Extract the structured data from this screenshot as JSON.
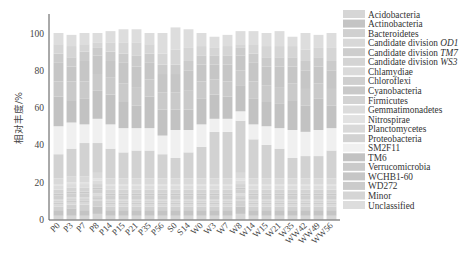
{
  "chart_data": {
    "type": "bar",
    "stacked": true,
    "title": "",
    "xlabel": "",
    "ylabel": "相对丰度/%",
    "ylim": [
      0,
      100
    ],
    "yticks": [
      0,
      20,
      40,
      60,
      80,
      100
    ],
    "grid": false,
    "legend_position": "right",
    "categories": [
      "P0",
      "P3",
      "P7",
      "P8",
      "P14",
      "P15",
      "P21",
      "P35",
      "P56",
      "S0",
      "S14",
      "W0",
      "W3",
      "W7",
      "W8",
      "W14",
      "W15",
      "W21",
      "W35",
      "WW42",
      "WW49",
      "WW56"
    ],
    "series": [
      {
        "name": "Acidobacteria",
        "color": "#d6d6d6",
        "values": [
          2,
          2,
          2,
          3,
          2,
          2,
          2,
          2,
          2,
          2,
          2,
          2,
          2,
          2,
          3,
          2,
          2,
          2,
          2,
          2,
          2,
          2
        ]
      },
      {
        "name": "Actinobacteria",
        "color": "#c4c4c4",
        "values": [
          3,
          4,
          3,
          4,
          3,
          3,
          3,
          3,
          3,
          3,
          3,
          3,
          3,
          3,
          4,
          3,
          3,
          3,
          3,
          3,
          3,
          3
        ]
      },
      {
        "name": "Bacteroidetes",
        "color": "#d0d0d0",
        "values": [
          2,
          2,
          3,
          3,
          2,
          2,
          2,
          2,
          2,
          2,
          2,
          2,
          2,
          2,
          3,
          2,
          2,
          2,
          2,
          2,
          2,
          2
        ]
      },
      {
        "name": "Candidate division OD1",
        "color": "#d8d8d8",
        "values": [
          1,
          1,
          1,
          1,
          1,
          1,
          1,
          1,
          1,
          1,
          1,
          1,
          1,
          1,
          1,
          1,
          1,
          1,
          1,
          1,
          1,
          1
        ]
      },
      {
        "name": "Candidate division TM7",
        "color": "#cdcdcd",
        "values": [
          1,
          1,
          1,
          1,
          1,
          1,
          1,
          1,
          1,
          1,
          1,
          1,
          1,
          1,
          1,
          1,
          1,
          1,
          1,
          1,
          1,
          1
        ]
      },
      {
        "name": "Candidate division WS3",
        "color": "#d4d4d4",
        "values": [
          1,
          1,
          1,
          1,
          1,
          1,
          1,
          1,
          1,
          1,
          1,
          1,
          1,
          1,
          1,
          1,
          1,
          1,
          1,
          1,
          1,
          1
        ]
      },
      {
        "name": "Chlamydiae",
        "color": "#dadada",
        "values": [
          1,
          1,
          1,
          1,
          1,
          1,
          1,
          1,
          1,
          1,
          1,
          1,
          1,
          1,
          1,
          1,
          1,
          1,
          1,
          1,
          1,
          1
        ]
      },
      {
        "name": "Chloroflexi",
        "color": "#cfcfcf",
        "values": [
          2,
          2,
          2,
          2,
          2,
          2,
          2,
          2,
          2,
          2,
          2,
          2,
          2,
          2,
          2,
          2,
          2,
          2,
          2,
          2,
          2,
          2
        ]
      },
      {
        "name": "Cyanobacteria",
        "color": "#c9c9c9",
        "values": [
          1,
          1,
          1,
          1,
          1,
          1,
          1,
          1,
          1,
          1,
          1,
          1,
          1,
          1,
          1,
          1,
          1,
          1,
          1,
          1,
          1,
          1
        ]
      },
      {
        "name": "Firmicutes",
        "color": "#d3d3d3",
        "values": [
          2,
          2,
          2,
          2,
          2,
          2,
          2,
          2,
          2,
          2,
          2,
          2,
          2,
          2,
          2,
          2,
          2,
          2,
          2,
          2,
          2,
          2
        ]
      },
      {
        "name": "Gemmatimonadetes",
        "color": "#dcdcdc",
        "values": [
          2,
          2,
          2,
          2,
          2,
          2,
          2,
          2,
          2,
          2,
          2,
          2,
          2,
          2,
          2,
          2,
          2,
          2,
          2,
          2,
          2,
          2
        ]
      },
      {
        "name": "Nitrospirae",
        "color": "#e2e2e2",
        "values": [
          1,
          1,
          1,
          1,
          1,
          1,
          1,
          1,
          1,
          1,
          1,
          1,
          1,
          1,
          1,
          1,
          1,
          1,
          1,
          1,
          1,
          1
        ]
      },
      {
        "name": "Planctomycetes",
        "color": "#d9d9d9",
        "values": [
          3,
          3,
          3,
          3,
          3,
          3,
          3,
          3,
          3,
          3,
          3,
          3,
          3,
          3,
          3,
          3,
          3,
          3,
          3,
          3,
          3,
          3
        ]
      },
      {
        "name": "Proteobacteria",
        "color": "#d2d2d2",
        "values": [
          13,
          15,
          18,
          16,
          16,
          14,
          15,
          15,
          13,
          11,
          14,
          17,
          25,
          25,
          28,
          21,
          18,
          16,
          11,
          12,
          12,
          15
        ]
      },
      {
        "name": "SM2F11",
        "color": "#f0f0f0",
        "values": [
          15,
          14,
          10,
          13,
          13,
          13,
          12,
          12,
          10,
          15,
          12,
          12,
          7,
          7,
          5,
          8,
          10,
          11,
          15,
          13,
          14,
          12
        ]
      },
      {
        "name": "TM6",
        "color": "#c2c2c2",
        "values": [
          16,
          12,
          14,
          15,
          16,
          14,
          12,
          17,
          14,
          11,
          11,
          14,
          13,
          12,
          14,
          14,
          13,
          13,
          16,
          14,
          17,
          12
        ]
      },
      {
        "name": "Verrucomicrobia",
        "color": "#cacaca",
        "values": [
          8,
          10,
          9,
          9,
          9,
          10,
          10,
          9,
          9,
          9,
          10,
          9,
          8,
          8,
          8,
          9,
          9,
          9,
          9,
          9,
          8,
          9
        ]
      },
      {
        "name": "WCHB1-60",
        "color": "#c6c6c6",
        "values": [
          10,
          8,
          11,
          10,
          9,
          11,
          11,
          9,
          10,
          10,
          11,
          9,
          8,
          9,
          8,
          10,
          10,
          11,
          9,
          10,
          9,
          10
        ]
      },
      {
        "name": "WD272",
        "color": "#cbcbcb",
        "values": [
          5,
          5,
          5,
          4,
          5,
          5,
          6,
          5,
          5,
          5,
          5,
          5,
          5,
          5,
          4,
          5,
          5,
          5,
          5,
          5,
          5,
          5
        ]
      },
      {
        "name": "Minor",
        "color": "#d5d5d5",
        "values": [
          5,
          6,
          4,
          3,
          5,
          6,
          7,
          5,
          6,
          8,
          7,
          5,
          4,
          5,
          2,
          5,
          6,
          6,
          6,
          6,
          5,
          7
        ]
      },
      {
        "name": "Unclassified",
        "color": "#dddddd",
        "values": [
          6,
          6,
          6,
          5,
          6,
          7,
          7,
          6,
          11,
          12,
          10,
          7,
          6,
          6,
          7,
          7,
          7,
          8,
          5,
          9,
          7,
          8
        ]
      }
    ]
  },
  "axis": {
    "ylabel": "相对丰度/%",
    "yticks": [
      "0",
      "20",
      "40",
      "60",
      "80",
      "100"
    ]
  },
  "legend": {
    "items": [
      {
        "label": "Acidobacteria",
        "italic_suffix": ""
      },
      {
        "label": "Actinobacteria",
        "italic_suffix": ""
      },
      {
        "label": "Bacteroidetes",
        "italic_suffix": ""
      },
      {
        "label": "Candidate division ",
        "italic_suffix": "OD1"
      },
      {
        "label": "Candidate division ",
        "italic_suffix": "TM7"
      },
      {
        "label": "Candidate division ",
        "italic_suffix": "WS3"
      },
      {
        "label": "Chlamydiae",
        "italic_suffix": ""
      },
      {
        "label": "Chloroflexi",
        "italic_suffix": ""
      },
      {
        "label": "Cyanobacteria",
        "italic_suffix": ""
      },
      {
        "label": "Firmicutes",
        "italic_suffix": ""
      },
      {
        "label": "Gemmatimonadetes",
        "italic_suffix": ""
      },
      {
        "label": "Nitrospirae",
        "italic_suffix": ""
      },
      {
        "label": "Planctomycetes",
        "italic_suffix": ""
      },
      {
        "label": "Proteobacteria",
        "italic_suffix": ""
      },
      {
        "label": "SM2F11",
        "italic_suffix": ""
      },
      {
        "label": "TM6",
        "italic_suffix": ""
      },
      {
        "label": "Verrucomicrobia",
        "italic_suffix": ""
      },
      {
        "label": "WCHB1-60",
        "italic_suffix": ""
      },
      {
        "label": "WD272",
        "italic_suffix": ""
      },
      {
        "label": "Minor",
        "italic_suffix": ""
      },
      {
        "label": "Unclassified",
        "italic_suffix": ""
      }
    ]
  }
}
